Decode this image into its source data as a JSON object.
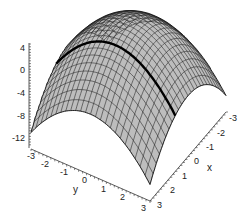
{
  "chart_data": {
    "type": "surface3d",
    "title": "",
    "function_description": "downward-opening paraboloid surface over x,y in [-3,3], peak near z≈4 at x=0,y=0, drops to about -12 at the corners; a thick black curve drawn across the surface along x≈0 direction",
    "x": {
      "label": "x",
      "ticks": [
        "-3",
        "-2",
        "-1",
        "0",
        "1",
        "2",
        "3"
      ],
      "range": [
        -3,
        3
      ]
    },
    "y": {
      "label": "y",
      "ticks": [
        "-3",
        "-2",
        "-1",
        "0",
        "1",
        "2",
        "3"
      ],
      "range": [
        -3,
        3
      ]
    },
    "z": {
      "label": "",
      "ticks": [
        "4",
        "0",
        "-4",
        "-8",
        "-12"
      ],
      "range": [
        -12,
        4
      ]
    },
    "surface_color": "#bdbdbd",
    "mesh_color": "#333333",
    "highlight_curve_color": "#000000",
    "grid": false,
    "legend": null
  },
  "axes": {
    "z_ticks": [
      "4",
      "0",
      "-4",
      "-8",
      "-12"
    ],
    "y_ticks": [
      "-3",
      "-2",
      "-1",
      "0",
      "1",
      "2",
      "3"
    ],
    "x_ticks": [
      "3",
      "2",
      "1",
      "0",
      "-1",
      "-2",
      "-3"
    ],
    "x_label": "x",
    "y_label": "y"
  }
}
